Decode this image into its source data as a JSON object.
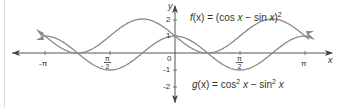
{
  "chart_data": {
    "type": "line",
    "title": "",
    "xlabel": "x",
    "ylabel": "y",
    "xlim": [
      -3.14159,
      3.14159
    ],
    "ylim": [
      -2,
      2
    ],
    "grid": false,
    "x_ticks": [
      {
        "value": -3.14159,
        "label": "-π"
      },
      {
        "value": -1.5708,
        "label": "-π/2"
      },
      {
        "value": 1.5708,
        "label": "π/2"
      },
      {
        "value": 3.14159,
        "label": "π"
      }
    ],
    "y_ticks": [
      {
        "value": 2,
        "label": "2"
      },
      {
        "value": 1,
        "label": "1"
      },
      {
        "value": 0,
        "label": "0"
      },
      {
        "value": -1,
        "label": "-1"
      },
      {
        "value": -2,
        "label": "-2"
      }
    ],
    "series": [
      {
        "name": "f(x) = (cos x − sin x)^2",
        "expression": "(cos(x) - sin(x))^2",
        "x": [
          -3.14,
          -2.36,
          -1.57,
          -0.79,
          0,
          0.79,
          1.57,
          2.36,
          3.14
        ],
        "values": [
          1,
          0,
          1,
          2,
          1,
          0,
          1,
          2,
          1
        ]
      },
      {
        "name": "g(x) = cos^2 x − sin^2 x",
        "expression": "cos(x)^2 - sin(x)^2",
        "x": [
          -3.14,
          -2.36,
          -1.57,
          -0.79,
          0,
          0.79,
          1.57,
          2.36,
          3.14
        ],
        "values": [
          1,
          0,
          -1,
          0,
          1,
          0,
          -1,
          0,
          1
        ]
      }
    ],
    "annotations": [
      {
        "text": "f(x) = (cos x − sin x)²",
        "near": "top-right of y-axis"
      },
      {
        "text": "g(x) = cos² x − sin² x",
        "near": "bottom-right of y-axis"
      }
    ]
  },
  "labels": {
    "x_axis": "x",
    "y_axis": "y",
    "neg_pi": "-π",
    "pi": "π",
    "pi_sym": "π",
    "two": "2",
    "neg_half_pi_num": "π",
    "neg_half_pi_den": "2",
    "neg_sign": "-",
    "half_pi_num": "π",
    "half_pi_den": "2",
    "y_2": "2",
    "y_1": "1",
    "y_0": "0",
    "y_neg1": "-1",
    "y_neg2": "-2",
    "f_name": "f",
    "f_arg": "(x)",
    "f_body": " = (cos ",
    "f_x1": "x",
    "f_minus": " − sin ",
    "f_x2": "x",
    "f_close": ")",
    "f_sup": "2",
    "g_name": "g",
    "g_arg": "(x)",
    "g_body": " = cos",
    "g_sup1": "2",
    "g_x1": " x",
    "g_minus": " − sin",
    "g_sup2": "2",
    "g_x2": " x"
  },
  "colors": {
    "curve": "#8a8a8a",
    "axis": "#555555",
    "text": "#333333"
  }
}
